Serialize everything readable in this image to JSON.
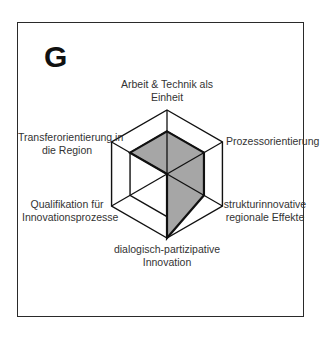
{
  "panel": {
    "letter": "G"
  },
  "chart_data": {
    "type": "radar",
    "title": "G",
    "axes": [
      "Arbeit & Technik als Einheit",
      "Prozessorientierung",
      "strukturinnovative regionale Effekte",
      "dialogisch-partizipative Innovation",
      "Qualifikation für Innovationsprozesse",
      "Transferorientierung in die Region"
    ],
    "rings": [
      2,
      3
    ],
    "range": [
      0,
      3
    ],
    "series": [
      {
        "name": "G",
        "values": [
          2,
          2,
          2,
          3,
          0,
          2
        ],
        "fill": "#a6a6a6",
        "stroke": "#111111"
      }
    ],
    "grid": true,
    "legend": "none"
  },
  "labels": {
    "top_line1": "Arbeit & Technik als",
    "top_line2": "Einheit",
    "ur_line1": "Prozessorientierung",
    "lr_line1": "strukturinnovative",
    "lr_line2": "regionale Effekte",
    "bottom_line1": "dialogisch-partizipative",
    "bottom_line2": "Innovation",
    "ll_line1": "Qualifikation für",
    "ll_line2": "Innovationsprozesse",
    "ul_line1": "Transferorientierung in",
    "ul_line2": "die Region"
  }
}
